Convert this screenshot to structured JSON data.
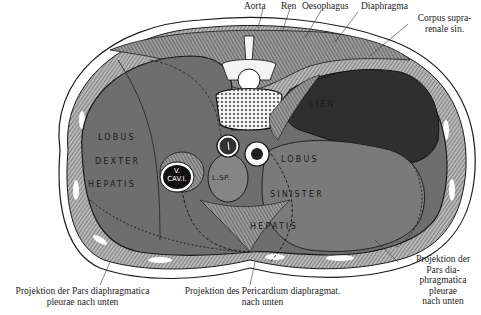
{
  "figure": {
    "colors": {
      "background": "#ffffff",
      "liver": "#6e6e6e",
      "spleen": "#3a3a3a",
      "wall": "#8a8a8a",
      "muscle_hatch": "#5a5a5a",
      "bone": "#f4f4f4",
      "outline": "#1a1a1a"
    }
  },
  "labels_top": {
    "aorta": "Aorta",
    "ren": "Ren",
    "oesophagus": "Oesophagus",
    "diaphragma": "Diaphragma",
    "corpus_line1": "Corpus supra-",
    "corpus_line2": "renale sin."
  },
  "organs": {
    "lobus_dexter_1": "LOBUS",
    "lobus_dexter_2": "DEXTER",
    "lobus_dexter_3": "HEPATIS",
    "lien": "LIEN",
    "lobus_sinister_1": "LOBUS",
    "lobus_sinister_2": "SINISTER",
    "lobus_sinister_3": "HEPATIS",
    "vena_cava_1": "V.",
    "vena_cava_2": "CAV.I.",
    "lobus_spigelii": "L.SP."
  },
  "labels_bottom": {
    "left_line1": "Projektion der Pars diaphragmatica",
    "left_line2": "pleurae nach unten",
    "center_line1": "Projektion des Pericardium diaphragmat.",
    "center_line2": "nach unten",
    "right_line1": "Projektion der",
    "right_line2": "Pars dia-",
    "right_line3": "phragmatica",
    "right_line4": "pleurae",
    "right_line5": "nach unten"
  }
}
